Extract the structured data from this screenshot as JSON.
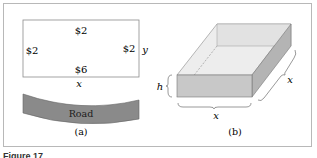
{
  "figure": {
    "caption": "Figure 17",
    "panel_a": {
      "label": "(a)",
      "top_cost": "$2",
      "left_cost": "$2",
      "right_cost": "$2",
      "bottom_cost": "$6",
      "width_var": "x",
      "height_var": "y",
      "road_label": "Road",
      "road_color": "#8a8a8a"
    },
    "panel_b": {
      "label": "(b)",
      "height_var": "h",
      "width_var": "x",
      "depth_var": "x",
      "top_face_color": "#eeeeee",
      "front_face_color": "#c8c8c8",
      "side_face_color": "#b4b4b4"
    }
  }
}
